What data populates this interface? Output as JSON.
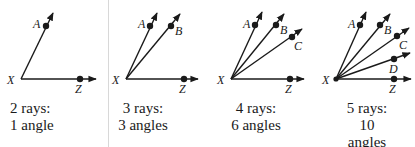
{
  "panels": [
    {
      "id": "p1",
      "vertex": {
        "label": "X",
        "x": 21,
        "y": 79
      },
      "rays": [
        {
          "label": "A",
          "point": [
            46,
            26
          ],
          "end": [
            53,
            13
          ],
          "label_pos": [
            33,
            28
          ]
        },
        {
          "label": "Z",
          "point": [
            80,
            79
          ],
          "end": [
            96,
            79
          ],
          "label_pos": [
            75,
            93
          ]
        }
      ],
      "caption": {
        "line1": "2 rays:",
        "line2": "1 angle",
        "x": 10,
        "align": "left"
      }
    },
    {
      "id": "p2",
      "vertex": {
        "label": "X",
        "x": 126,
        "y": 79
      },
      "rays": [
        {
          "label": "A",
          "point": [
            150,
            26
          ],
          "end": [
            157,
            13
          ],
          "label_pos": [
            138,
            28
          ]
        },
        {
          "label": "B",
          "point": [
            171,
            26
          ],
          "end": [
            180,
            14
          ],
          "label_pos": [
            175,
            35
          ]
        },
        {
          "label": "Z",
          "point": [
            184,
            79
          ],
          "end": [
            198,
            79
          ],
          "label_pos": [
            179,
            93
          ]
        }
      ],
      "caption": {
        "line1": "3 rays:",
        "line2": "3 angles",
        "x": 143,
        "align": "center"
      }
    },
    {
      "id": "p3",
      "vertex": {
        "label": "X",
        "x": 231,
        "y": 79
      },
      "rays": [
        {
          "label": "A",
          "point": [
            255,
            25
          ],
          "end": [
            262,
            12
          ],
          "label_pos": [
            243,
            28
          ]
        },
        {
          "label": "B",
          "point": [
            276,
            25
          ],
          "end": [
            284,
            14
          ],
          "label_pos": [
            280,
            34
          ]
        },
        {
          "label": "C",
          "point": [
            292,
            37
          ],
          "end": [
            302,
            29
          ],
          "label_pos": [
            294,
            50
          ]
        },
        {
          "label": "Z",
          "point": [
            290,
            79
          ],
          "end": [
            304,
            79
          ],
          "label_pos": [
            285,
            93
          ]
        }
      ],
      "caption": {
        "line1": "4 rays:",
        "line2": "6 angles",
        "x": 256,
        "align": "center"
      }
    },
    {
      "id": "p4",
      "vertex": {
        "label": "X",
        "x": 336,
        "y": 79
      },
      "rays": [
        {
          "label": "A",
          "point": [
            360,
            25
          ],
          "end": [
            366,
            12
          ],
          "label_pos": [
            348,
            28
          ]
        },
        {
          "label": "B",
          "point": [
            380,
            25
          ],
          "end": [
            390,
            14
          ],
          "label_pos": [
            384,
            34
          ]
        },
        {
          "label": "C",
          "point": [
            397,
            36
          ],
          "end": [
            409,
            28
          ],
          "label_pos": [
            399,
            49
          ]
        },
        {
          "label": "D",
          "point": [
            394,
            59
          ],
          "end": [
            410,
            53
          ],
          "label_pos": [
            389,
            73
          ]
        },
        {
          "label": "Z",
          "point": [
            394,
            79
          ],
          "end": [
            411,
            79
          ],
          "label_pos": [
            389,
            93
          ]
        }
      ],
      "caption": {
        "line1": "5 rays:",
        "line2": "10 angles",
        "x": 367,
        "align": "center"
      }
    }
  ],
  "colors": {
    "ink": "#1a1a1a",
    "divider": "#d8d8d8",
    "background": "#ffffff"
  }
}
